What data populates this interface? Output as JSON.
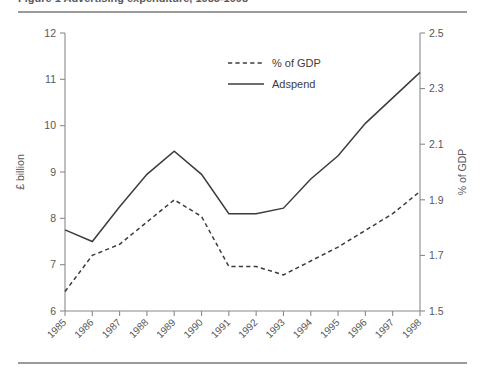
{
  "caption": {
    "text": "Figure 1  Advertising expenditure, 1985-1998"
  },
  "colors": {
    "line": "#3c3c3c",
    "axis": "#8a8a8a",
    "rule": "#9a9a9a",
    "text": "#585858",
    "background": "#ffffff"
  },
  "legend": {
    "position": "inside-top-center",
    "entries": [
      {
        "label": "% of GDP",
        "style": "dashed"
      },
      {
        "label": "Adspend",
        "style": "solid"
      }
    ]
  },
  "axes": {
    "left": {
      "title": "£ billion",
      "ticks": [
        "12",
        "11",
        "10",
        "9",
        "8",
        "7",
        "6"
      ]
    },
    "right": {
      "title": "% of GDP",
      "ticks": [
        "2.5",
        "2.3",
        "2.1",
        "1.9",
        "1.7",
        "1.5"
      ]
    },
    "bottom": {
      "title": ""
    }
  },
  "chart_data": {
    "type": "line",
    "title": "Figure 1  Advertising expenditure, 1985-1998",
    "xlabel": "",
    "ylabel": "£ billion",
    "y2label": "% of GDP",
    "grid": false,
    "legend_position": "inside-top-center",
    "categories": [
      "1985",
      "1986",
      "1987",
      "1988",
      "1989",
      "1990",
      "1991",
      "1992",
      "1993",
      "1994",
      "1995",
      "1996",
      "1997",
      "1998"
    ],
    "x": [
      1985,
      1986,
      1987,
      1988,
      1989,
      1990,
      1991,
      1992,
      1993,
      1994,
      1995,
      1996,
      1997,
      1998
    ],
    "ylim": [
      6,
      12
    ],
    "yticks": [
      6,
      7,
      8,
      9,
      10,
      11,
      12
    ],
    "y2lim": [
      1.5,
      2.5
    ],
    "y2ticks": [
      1.5,
      1.7,
      1.9,
      2.1,
      2.3,
      2.5
    ],
    "series": [
      {
        "name": "Adspend",
        "axis": "left",
        "unit": "£ billion",
        "style": "solid",
        "values": [
          7.75,
          7.5,
          8.25,
          8.95,
          9.45,
          8.95,
          8.1,
          8.1,
          8.22,
          8.85,
          9.35,
          10.05,
          10.6,
          11.15
        ]
      },
      {
        "name": "% of GDP",
        "axis": "right",
        "unit": "% of GDP",
        "style": "dashed",
        "values": [
          1.57,
          1.7,
          1.74,
          1.82,
          1.9,
          1.84,
          1.66,
          1.66,
          1.63,
          1.68,
          1.73,
          1.79,
          1.85,
          1.93
        ]
      }
    ]
  }
}
